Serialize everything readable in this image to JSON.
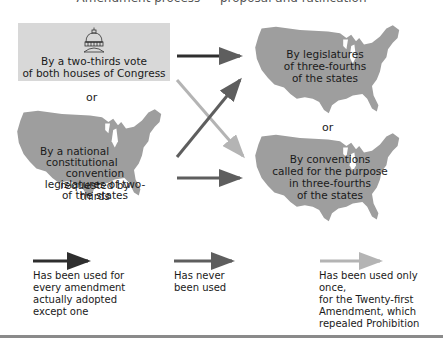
{
  "diagram": {
    "title_partial": "Amendment process — proposal and ratification",
    "proposal_methods": [
      {
        "id": "congress",
        "label_lines": [
          "By a two-thirds vote",
          "of both houses of Congress"
        ],
        "icon": "capitol-dome-icon"
      },
      {
        "id": "convention",
        "label_lines": [
          "By a national",
          "constitutional",
          "convention requested by",
          "legislatures of two-thirds",
          "of the states"
        ],
        "icon": "us-map"
      }
    ],
    "ratification_methods": [
      {
        "id": "legislatures",
        "label_lines": [
          "By legislatures",
          "of three-fourths",
          "of the states"
        ],
        "icon": "us-map"
      },
      {
        "id": "conventions",
        "label_lines": [
          "By conventions",
          "called for the purpose",
          "in three-fourths",
          "of the states"
        ],
        "icon": "us-map"
      }
    ],
    "or_left": "or",
    "or_right": "or",
    "arrows": [
      {
        "from": "congress",
        "to": "legislatures",
        "style": "dark"
      },
      {
        "from": "congress",
        "to": "conventions",
        "style": "light"
      },
      {
        "from": "convention",
        "to": "legislatures",
        "style": "medium"
      },
      {
        "from": "convention",
        "to": "conventions",
        "style": "medium"
      }
    ],
    "colors": {
      "dark": "#2e2e2e",
      "medium": "#5e5e5e",
      "light": "#b4b4b4",
      "map": "#9e9e9e",
      "box": "#d8d8d8"
    }
  },
  "legend": [
    {
      "style": "dark",
      "lines": [
        "Has been used for",
        "every amendment",
        "actually adopted",
        "except one"
      ]
    },
    {
      "style": "medium",
      "lines": [
        "Has never",
        "been used"
      ]
    },
    {
      "style": "light",
      "lines": [
        "Has been used only once,",
        "for the Twenty-first",
        "Amendment, which",
        "repealed Prohibition"
      ]
    }
  ]
}
